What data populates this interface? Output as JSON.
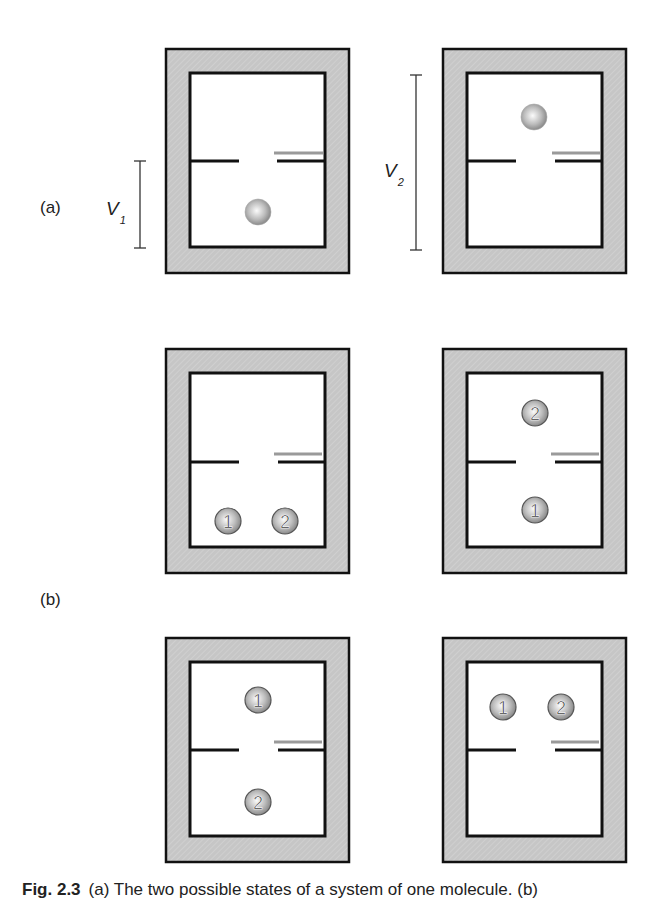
{
  "figure": {
    "part_labels": {
      "a": "(a)",
      "b": "(b)"
    },
    "volume_labels": {
      "v1": {
        "symbol": "V",
        "subscript": "1"
      },
      "v2": {
        "symbol": "V",
        "subscript": "2"
      }
    },
    "caption": {
      "number": "Fig. 2.3",
      "text": "(a) The two possible states of a system of one molecule. (b)"
    },
    "colors": {
      "wall_fill": "#c8c8c8",
      "outline": "#111111",
      "partition_gray": "#9a9a9a",
      "ball_light": "#f4f4f4",
      "ball_dark": "#8a8a8a"
    },
    "panels": [
      {
        "id": "a-left",
        "row": "a",
        "balls": [
          {
            "label": "",
            "cx": 258,
            "cy": 212
          }
        ]
      },
      {
        "id": "a-right",
        "row": "a",
        "balls": [
          {
            "label": "",
            "cx": 534,
            "cy": 117
          }
        ]
      },
      {
        "id": "b1-left",
        "row": "b",
        "balls": [
          {
            "label": "1",
            "cx": 228,
            "cy": 521
          },
          {
            "label": "2",
            "cx": 285,
            "cy": 521
          }
        ]
      },
      {
        "id": "b1-right",
        "row": "b",
        "balls": [
          {
            "label": "2",
            "cx": 535,
            "cy": 413
          },
          {
            "label": "1",
            "cx": 535,
            "cy": 510
          }
        ]
      },
      {
        "id": "b2-left",
        "row": "b",
        "balls": [
          {
            "label": "1",
            "cx": 258,
            "cy": 700
          },
          {
            "label": "2",
            "cx": 258,
            "cy": 802
          }
        ]
      },
      {
        "id": "b2-right",
        "row": "b",
        "balls": [
          {
            "label": "1",
            "cx": 503,
            "cy": 707
          },
          {
            "label": "2",
            "cx": 561,
            "cy": 707
          }
        ]
      }
    ]
  }
}
